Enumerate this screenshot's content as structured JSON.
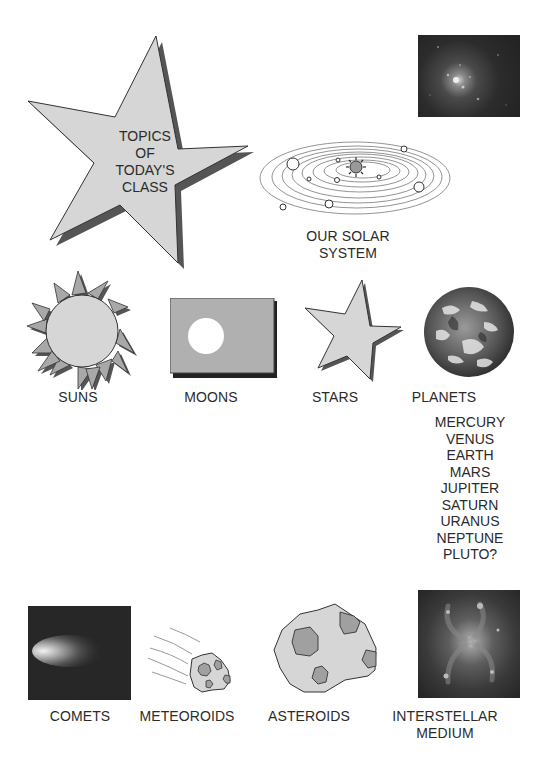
{
  "title_star": {
    "lines": [
      "TOPICS",
      "OF",
      "TODAY'S",
      "CLASS"
    ]
  },
  "solar_system": {
    "label_lines": [
      "OUR SOLAR",
      "SYSTEM"
    ]
  },
  "topics": {
    "suns": {
      "label": "SUNS",
      "icon": "sun-icon"
    },
    "moons": {
      "label": "MOONS",
      "icon": "moon-icon"
    },
    "stars": {
      "label": "STARS",
      "icon": "star-icon"
    },
    "planets": {
      "label": "PLANETS",
      "icon": "earth-icon",
      "list": [
        "MERCURY",
        "VENUS",
        "EARTH",
        "MARS",
        "JUPITER",
        "SATURN",
        "URANUS",
        "NEPTUNE",
        "PLUTO?"
      ]
    },
    "comets": {
      "label": "COMETS",
      "icon": "comet-photo"
    },
    "meteoroids": {
      "label": "METEOROIDS",
      "icon": "meteoroid-icon"
    },
    "asteroids": {
      "label": "ASTEROIDS",
      "icon": "asteroid-icon"
    },
    "interstellar_medium": {
      "label_lines": [
        "INTERSTELLAR",
        "MEDIUM"
      ],
      "icon": "galaxy-photo"
    }
  },
  "colors": {
    "shape_fill": "#d6d6d6",
    "shape_dark": "#a8a8a8",
    "shadow": "#444444",
    "outline": "#333333",
    "photo_bg": "#2a2a2a"
  }
}
